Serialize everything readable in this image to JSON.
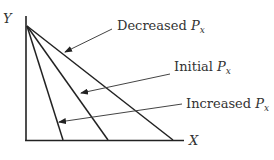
{
  "diagram": {
    "axes": {
      "y_label": "Y",
      "x_label": "X"
    },
    "lines": [
      {
        "id": "decreased",
        "label_prefix": "Decreased ",
        "label_var": "P",
        "label_sub": "x"
      },
      {
        "id": "initial",
        "label_prefix": "Initial ",
        "label_var": "P",
        "label_sub": "x"
      },
      {
        "id": "increased",
        "label_prefix": "Increased ",
        "label_var": "P",
        "label_sub": "x"
      }
    ],
    "colors": {
      "lines": "#222222",
      "arrows": "#444444",
      "text": "#333333"
    }
  }
}
